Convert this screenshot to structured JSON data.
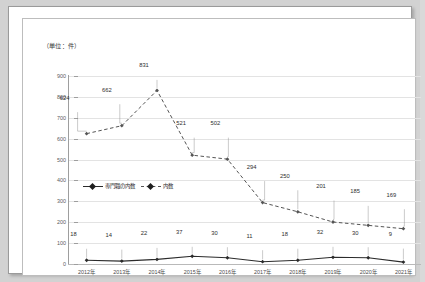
{
  "unit_label": "（単位：件）",
  "chart_data": {
    "type": "line",
    "title": "",
    "xlabel": "",
    "ylabel": "",
    "unit_note": "（単位：件）",
    "categories": [
      "2012年",
      "2013年",
      "2014年",
      "2015年",
      "2016年",
      "2017年",
      "2018年",
      "2019年",
      "2020年",
      "2021年"
    ],
    "ylim": [
      0,
      900
    ],
    "ytick_values": [
      0,
      100,
      200,
      300,
      400,
      500,
      600,
      700,
      800,
      900
    ],
    "ytick_labels": [
      "0",
      "100",
      "200",
      "300",
      "400",
      "500",
      "600",
      "700",
      "800",
      "900"
    ],
    "grid": "horizontal",
    "legend_position": "inside-left-middle",
    "series": [
      {
        "name": "内数",
        "style": "dashed",
        "marker": "diamond",
        "color": "#555555",
        "values": [
          624,
          662,
          831,
          521,
          502,
          294,
          250,
          201,
          185,
          169
        ],
        "labels": [
          "624",
          "662",
          "831",
          "521",
          "502",
          "294",
          "250",
          "201",
          "185",
          "169"
        ]
      },
      {
        "name": "専門職の内数",
        "style": "solid",
        "marker": "diamond",
        "color": "#2b2b2b",
        "values": [
          18,
          14,
          22,
          37,
          30,
          11,
          18,
          32,
          30,
          9
        ],
        "labels": [
          "18",
          "14",
          "22",
          "37",
          "30",
          "11",
          "18",
          "32",
          "30",
          "9"
        ]
      }
    ]
  }
}
